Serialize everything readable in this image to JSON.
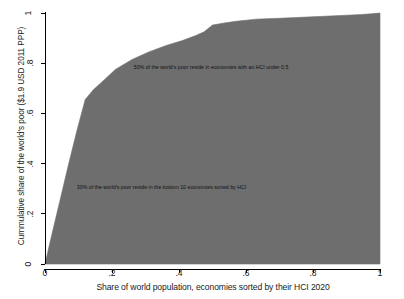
{
  "chart_data": {
    "type": "area",
    "title": "",
    "subtitle": "",
    "xlabel": "Share of world population, economies sorted by their HCI 2020",
    "ylabel": "Cummulative share of the world's poor ($1.9 USD 2011 PPP)",
    "xlim": [
      0,
      1
    ],
    "ylim": [
      0,
      1
    ],
    "xticks": [
      "0",
      ".2",
      ".4",
      ".6",
      ".8",
      "1"
    ],
    "xtick_values": [
      0,
      0.2,
      0.4,
      0.6,
      0.8,
      1
    ],
    "yticks": [
      "0",
      ".2",
      ".4",
      ".6",
      ".8",
      "1"
    ],
    "ytick_values": [
      0,
      0.2,
      0.4,
      0.6,
      0.8,
      1
    ],
    "grid": false,
    "legend": "none",
    "fill_color": "#6e6e6e",
    "line_color": "#6e6e6e",
    "background_color": "#ffffff",
    "axis_color": "#000000",
    "series": [
      {
        "name": "Cumulative share of the world's poor",
        "x": [
          0,
          0.02,
          0.045,
          0.07,
          0.095,
          0.12,
          0.145,
          0.17,
          0.21,
          0.26,
          0.31,
          0.36,
          0.41,
          0.45,
          0.475,
          0.5,
          0.535,
          0.57,
          0.6,
          0.63,
          0.66,
          0.7,
          0.75,
          0.8,
          0.85,
          0.9,
          0.945,
          0.975,
          1.0
        ],
        "y": [
          0,
          0.115,
          0.255,
          0.395,
          0.53,
          0.655,
          0.695,
          0.725,
          0.775,
          0.815,
          0.845,
          0.87,
          0.89,
          0.91,
          0.925,
          0.952,
          0.96,
          0.967,
          0.971,
          0.9755,
          0.977,
          0.979,
          0.982,
          0.985,
          0.988,
          0.991,
          0.994,
          0.997,
          1.0
        ]
      }
    ],
    "annotations": [
      {
        "name": "annotation-hci-under-half",
        "text": "50% of the world's poor reside in economies with an HCI under 0.5",
        "x": 0.265,
        "y": 0.785
      },
      {
        "name": "annotation-bottom-ten",
        "text": "30% of the world's poor reside in the bottom 10 economies sorted by HCI",
        "x": 0.095,
        "y": 0.305
      }
    ]
  },
  "axes": {
    "x_title": "Share of world population, economies sorted by their HCI 2020",
    "y_title": "Cummulative share of the world's poor ($1.9 USD 2011 PPP)"
  }
}
